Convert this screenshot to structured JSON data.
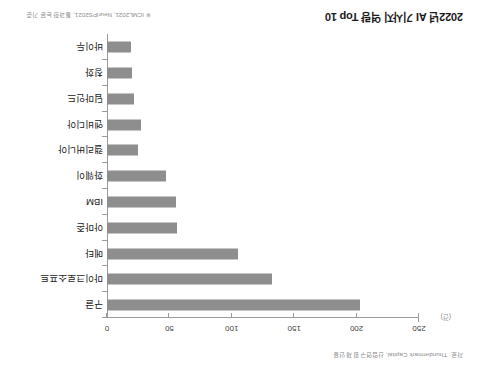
{
  "figure": {
    "rotation_degrees": 180,
    "source_note": "자료: Thundermark Capital, 산업연구원 재인용",
    "data_note": "※ ICML2021, NeurIPS2021, 통과한 논문 기준",
    "unit_label": "(건)",
    "bar_color": "#8e8e8e",
    "axis_color": "#9a9a9a"
  },
  "chart_data": {
    "type": "bar",
    "orientation": "horizontal",
    "title": "2022년 AI 기사지 역량 Top 10",
    "xlabel": "(건)",
    "ylabel": "",
    "xlim": [
      0,
      250
    ],
    "xticks": [
      0,
      50,
      100,
      150,
      200,
      250
    ],
    "xtick_labels": [
      "0",
      "50",
      "100",
      "150",
      "200",
      "250"
    ],
    "grid": false,
    "legend": "none",
    "categories": [
      "구글",
      "마이크로소프트",
      "메타",
      "아마존",
      "IBM",
      "화웨이",
      "캘리버니아",
      "엔비디아",
      "딥마인드",
      "칭화",
      "바이두"
    ],
    "values": [
      203,
      132,
      105,
      56,
      55,
      47,
      25,
      27,
      22,
      20,
      19
    ],
    "series": [
      {
        "name": "AI 논문 수",
        "values": [
          203,
          132,
          105,
          56,
          55,
          47,
          25,
          27,
          22,
          20,
          19
        ]
      }
    ]
  }
}
